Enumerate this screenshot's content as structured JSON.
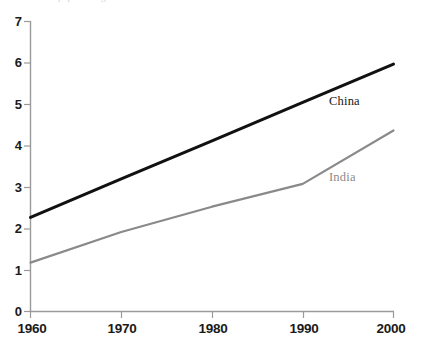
{
  "figure": {
    "caption_remnant": "population growth in billions over time in selected countries",
    "background_color": "#ffffff"
  },
  "axes": {
    "y_ticks": [
      "0",
      "1",
      "2",
      "3",
      "4",
      "5",
      "6",
      "7"
    ],
    "x_ticks": [
      "1960",
      "1970",
      "1980",
      "1990",
      "2000"
    ],
    "axis_color": "#9a9a9a"
  },
  "labels": {
    "china": "China",
    "india": "India"
  },
  "chart_data": {
    "type": "line",
    "title": "",
    "subtitle": "",
    "xlabel": "",
    "ylabel": "",
    "xlim": [
      1960,
      2000
    ],
    "ylim": [
      0,
      7
    ],
    "x": [
      1960,
      1970,
      1980,
      1990,
      2000
    ],
    "xticks": [
      1960,
      1970,
      1980,
      1990,
      2000
    ],
    "yticks": [
      0,
      1,
      2,
      3,
      4,
      5,
      6,
      7
    ],
    "grid": false,
    "legend": "inline-labels-at-line-ends",
    "series": [
      {
        "name": "China",
        "color": "#111111",
        "line_width": 3,
        "values": [
          2.27,
          3.2,
          4.12,
          5.05,
          5.97
        ]
      },
      {
        "name": "India",
        "color": "#8a8a8a",
        "line_width": 2.2,
        "values": [
          1.18,
          1.92,
          2.53,
          3.08,
          4.37
        ]
      }
    ],
    "annotations": [
      {
        "text": "China",
        "x": 2000,
        "y": 5.05,
        "color": "#141414"
      },
      {
        "text": "India",
        "x": 2000,
        "y": 3.1,
        "color": "#8a8a8a"
      }
    ]
  }
}
